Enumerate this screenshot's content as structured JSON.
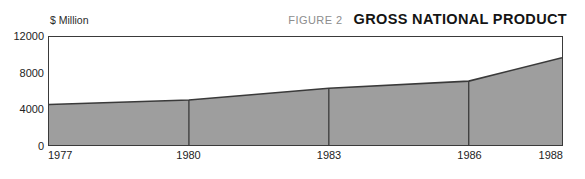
{
  "header": {
    "figure_label": "FIGURE 2",
    "title": "GROSS NATIONAL PRODUCT"
  },
  "unit_label": "$ Million",
  "colors": {
    "area_fill": "#9e9e9e",
    "area_stroke": "#3a3a3a",
    "frame": "#3a3a3a",
    "divider": "#3a3a3a",
    "title": "#141414",
    "figure_label": "#8d8d8d",
    "background": "#ffffff"
  },
  "axes": {
    "y_ticks": [
      {
        "label": "12000",
        "value": 12000
      },
      {
        "label": "8000",
        "value": 8000
      },
      {
        "label": "4000",
        "value": 4000
      },
      {
        "label": "0",
        "value": 0
      }
    ],
    "x_ticks": [
      {
        "label": "1977",
        "value": 1977
      },
      {
        "label": "1980",
        "value": 1980
      },
      {
        "label": "1983",
        "value": 1983
      },
      {
        "label": "1986",
        "value": 1986
      },
      {
        "label": "1988",
        "value": 1988
      }
    ]
  },
  "chart_data": {
    "type": "area",
    "title": "GROSS NATIONAL PRODUCT",
    "subtitle": "FIGURE 2",
    "xlabel": "",
    "ylabel": "$ Million",
    "x": [
      1977,
      1980,
      1983,
      1986,
      1988
    ],
    "categories": [
      "1977",
      "1980",
      "1983",
      "1986",
      "1988"
    ],
    "values": [
      4500,
      5000,
      6300,
      7100,
      9700
    ],
    "series": [
      {
        "name": "Gross National Product",
        "values": [
          4500,
          5000,
          6300,
          7100,
          9700
        ]
      }
    ],
    "xlim": [
      1977,
      1988
    ],
    "ylim": [
      0,
      12000
    ],
    "y_ticks": [
      0,
      4000,
      8000,
      12000
    ],
    "x_ticks": [
      1977,
      1980,
      1983,
      1986,
      1988
    ],
    "grid": false,
    "legend": false,
    "dividers_at": [
      1980,
      1983,
      1986
    ],
    "fill_color": "#9e9e9e",
    "line_color": "#3a3a3a"
  }
}
